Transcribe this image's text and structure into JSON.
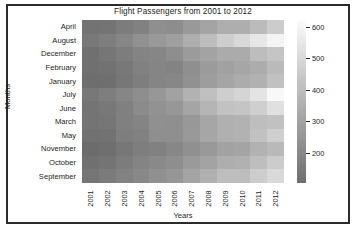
{
  "chart_data": {
    "type": "heatmap",
    "title": "Flight Passengers from 2001 to 2012",
    "xlabel": "Years",
    "ylabel": "Months",
    "x_tick_labels": [
      "2001",
      "2002",
      "2003",
      "2004",
      "2005",
      "2006",
      "2007",
      "2008",
      "2009",
      "2010",
      "2011",
      "2012"
    ],
    "y_tick_labels": [
      "April",
      "August",
      "December",
      "February",
      "January",
      "July",
      "June",
      "March",
      "May",
      "November",
      "October",
      "September"
    ],
    "colormap": "grayscale",
    "colorbar": {
      "ticks": [
        200,
        300,
        400,
        500,
        600
      ],
      "vmin": 104,
      "vmax": 622,
      "position": "right",
      "orientation": "vertical"
    },
    "grid": false,
    "rows": [
      {
        "month": "April",
        "values": [
          129,
          135,
          163,
          181,
          235,
          227,
          269,
          313,
          348,
          348,
          396,
          461
        ]
      },
      {
        "month": "August",
        "values": [
          148,
          170,
          199,
          242,
          272,
          293,
          347,
          405,
          467,
          505,
          559,
          606
        ]
      },
      {
        "month": "December",
        "values": [
          118,
          140,
          166,
          194,
          201,
          229,
          278,
          306,
          336,
          337,
          405,
          432
        ]
      },
      {
        "month": "February",
        "values": [
          118,
          126,
          150,
          180,
          196,
          188,
          233,
          277,
          301,
          318,
          342,
          391
        ]
      },
      {
        "month": "January",
        "values": [
          112,
          115,
          145,
          171,
          196,
          204,
          242,
          284,
          315,
          340,
          360,
          417
        ]
      },
      {
        "month": "July",
        "values": [
          148,
          170,
          199,
          230,
          264,
          302,
          364,
          413,
          465,
          491,
          548,
          622
        ]
      },
      {
        "month": "June",
        "values": [
          135,
          149,
          178,
          218,
          243,
          264,
          315,
          374,
          422,
          435,
          472,
          535
        ]
      },
      {
        "month": "March",
        "values": [
          132,
          141,
          178,
          193,
          236,
          235,
          267,
          317,
          356,
          362,
          406,
          419
        ]
      },
      {
        "month": "May",
        "values": [
          121,
          125,
          172,
          183,
          229,
          234,
          270,
          318,
          355,
          363,
          420,
          472
        ]
      },
      {
        "month": "November",
        "values": [
          104,
          114,
          146,
          172,
          180,
          203,
          237,
          271,
          305,
          310,
          362,
          390
        ]
      },
      {
        "month": "October",
        "values": [
          119,
          133,
          162,
          191,
          211,
          229,
          274,
          306,
          347,
          359,
          407,
          461
        ]
      },
      {
        "month": "September",
        "values": [
          136,
          158,
          184,
          209,
          237,
          259,
          312,
          355,
          404,
          404,
          463,
          508
        ]
      }
    ]
  },
  "axes": {
    "title": "Flight Passengers from 2001 to 2012",
    "xlabel": "Years",
    "ylabel": "Months"
  }
}
